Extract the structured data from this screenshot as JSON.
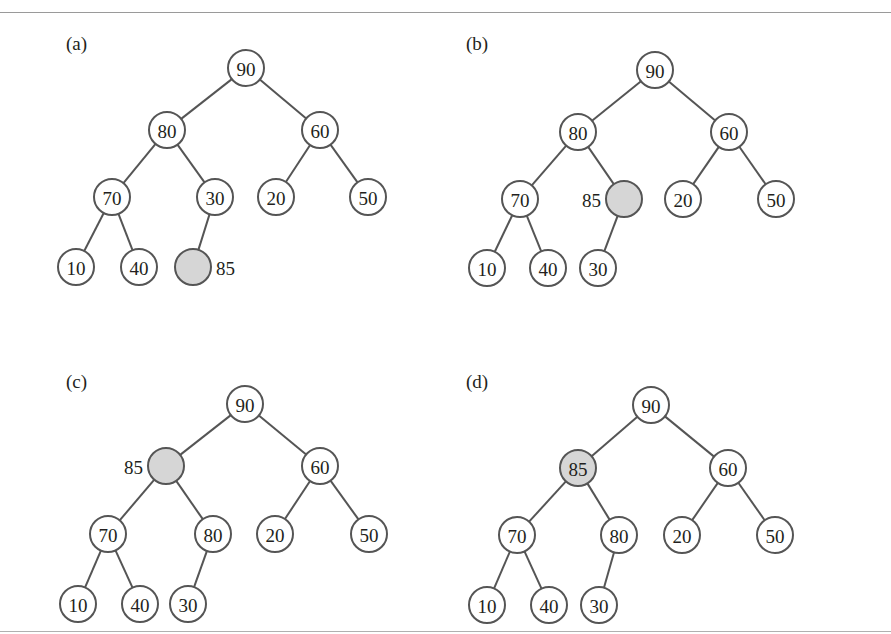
{
  "figure": {
    "highlight_color": "#d6d6d6",
    "line_color": "#555555",
    "node_radius": 18,
    "panels": [
      {
        "label": "(a)",
        "label_pos": [
          66,
          50
        ],
        "nodes": [
          {
            "id": "n1",
            "value": "90",
            "x": 246,
            "y": 68
          },
          {
            "id": "n2",
            "value": "80",
            "x": 167,
            "y": 130
          },
          {
            "id": "n3",
            "value": "60",
            "x": 320,
            "y": 130
          },
          {
            "id": "n4",
            "value": "70",
            "x": 112,
            "y": 197
          },
          {
            "id": "n5",
            "value": "30",
            "x": 215,
            "y": 197
          },
          {
            "id": "n6",
            "value": "20",
            "x": 276,
            "y": 197
          },
          {
            "id": "n7",
            "value": "50",
            "x": 368,
            "y": 197
          },
          {
            "id": "n8",
            "value": "10",
            "x": 76,
            "y": 267
          },
          {
            "id": "n9",
            "value": "40",
            "x": 139,
            "y": 267
          },
          {
            "id": "n10",
            "value": "",
            "x": 193,
            "y": 267,
            "highlight": true,
            "outside_label": "85",
            "outside_side": "right"
          }
        ],
        "edges": [
          [
            "n1",
            "n2"
          ],
          [
            "n1",
            "n3"
          ],
          [
            "n2",
            "n4"
          ],
          [
            "n2",
            "n5"
          ],
          [
            "n3",
            "n6"
          ],
          [
            "n3",
            "n7"
          ],
          [
            "n4",
            "n8"
          ],
          [
            "n4",
            "n9"
          ],
          [
            "n5",
            "n10"
          ]
        ]
      },
      {
        "label": "(b)",
        "label_pos": [
          466,
          50
        ],
        "nodes": [
          {
            "id": "n1",
            "value": "90",
            "x": 655,
            "y": 70
          },
          {
            "id": "n2",
            "value": "80",
            "x": 578,
            "y": 132
          },
          {
            "id": "n3",
            "value": "60",
            "x": 729,
            "y": 132
          },
          {
            "id": "n4",
            "value": "70",
            "x": 520,
            "y": 199
          },
          {
            "id": "n5",
            "value": "",
            "x": 624,
            "y": 199,
            "highlight": true,
            "outside_label": "85",
            "outside_side": "left"
          },
          {
            "id": "n6",
            "value": "20",
            "x": 683,
            "y": 199
          },
          {
            "id": "n7",
            "value": "50",
            "x": 776,
            "y": 199
          },
          {
            "id": "n8",
            "value": "10",
            "x": 487,
            "y": 268
          },
          {
            "id": "n9",
            "value": "40",
            "x": 548,
            "y": 268
          },
          {
            "id": "n10",
            "value": "30",
            "x": 598,
            "y": 268
          }
        ],
        "edges": [
          [
            "n1",
            "n2"
          ],
          [
            "n1",
            "n3"
          ],
          [
            "n2",
            "n4"
          ],
          [
            "n2",
            "n5"
          ],
          [
            "n3",
            "n6"
          ],
          [
            "n3",
            "n7"
          ],
          [
            "n4",
            "n8"
          ],
          [
            "n4",
            "n9"
          ],
          [
            "n5",
            "n10"
          ]
        ]
      },
      {
        "label": "(c)",
        "label_pos": [
          66,
          388
        ],
        "nodes": [
          {
            "id": "n1",
            "value": "90",
            "x": 245,
            "y": 404
          },
          {
            "id": "n2",
            "value": "",
            "x": 166,
            "y": 466,
            "highlight": true,
            "outside_label": "85",
            "outside_side": "left"
          },
          {
            "id": "n3",
            "value": "60",
            "x": 320,
            "y": 466
          },
          {
            "id": "n4",
            "value": "70",
            "x": 108,
            "y": 534
          },
          {
            "id": "n5",
            "value": "80",
            "x": 213,
            "y": 534
          },
          {
            "id": "n6",
            "value": "20",
            "x": 275,
            "y": 534
          },
          {
            "id": "n7",
            "value": "50",
            "x": 369,
            "y": 534
          },
          {
            "id": "n8",
            "value": "10",
            "x": 78,
            "y": 604
          },
          {
            "id": "n9",
            "value": "40",
            "x": 140,
            "y": 604
          },
          {
            "id": "n10",
            "value": "30",
            "x": 188,
            "y": 604
          }
        ],
        "edges": [
          [
            "n1",
            "n2"
          ],
          [
            "n1",
            "n3"
          ],
          [
            "n2",
            "n4"
          ],
          [
            "n2",
            "n5"
          ],
          [
            "n3",
            "n6"
          ],
          [
            "n3",
            "n7"
          ],
          [
            "n4",
            "n8"
          ],
          [
            "n4",
            "n9"
          ],
          [
            "n5",
            "n10"
          ]
        ]
      },
      {
        "label": "(d)",
        "label_pos": [
          466,
          388
        ],
        "nodes": [
          {
            "id": "n1",
            "value": "90",
            "x": 651,
            "y": 405
          },
          {
            "id": "n2",
            "value": "85",
            "x": 578,
            "y": 468,
            "highlight": true
          },
          {
            "id": "n3",
            "value": "60",
            "x": 728,
            "y": 468
          },
          {
            "id": "n4",
            "value": "70",
            "x": 517,
            "y": 535
          },
          {
            "id": "n5",
            "value": "80",
            "x": 619,
            "y": 535
          },
          {
            "id": "n6",
            "value": "20",
            "x": 682,
            "y": 535
          },
          {
            "id": "n7",
            "value": "50",
            "x": 775,
            "y": 535
          },
          {
            "id": "n8",
            "value": "10",
            "x": 487,
            "y": 605
          },
          {
            "id": "n9",
            "value": "40",
            "x": 549,
            "y": 605
          },
          {
            "id": "n10",
            "value": "30",
            "x": 599,
            "y": 605
          }
        ],
        "edges": [
          [
            "n1",
            "n2"
          ],
          [
            "n1",
            "n3"
          ],
          [
            "n2",
            "n4"
          ],
          [
            "n2",
            "n5"
          ],
          [
            "n3",
            "n6"
          ],
          [
            "n3",
            "n7"
          ],
          [
            "n4",
            "n8"
          ],
          [
            "n4",
            "n9"
          ],
          [
            "n5",
            "n10"
          ]
        ]
      }
    ]
  }
}
